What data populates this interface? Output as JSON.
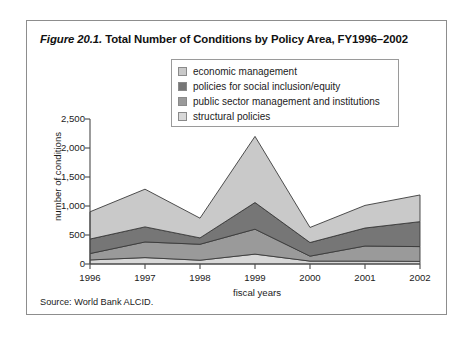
{
  "figure": {
    "number": "Figure 20.1.",
    "title": " Total Number of Conditions by Policy Area, FY1996–2002",
    "source": "Source: World Bank ALCID."
  },
  "legend": {
    "items": [
      {
        "label": "economic management",
        "color": "#c9c9c9"
      },
      {
        "label": "policies for social inclusion/equity",
        "color": "#767676"
      },
      {
        "label": "public sector management and institutions",
        "color": "#9a9a9a"
      },
      {
        "label": "structural policies",
        "color": "#d8d8d8"
      }
    ]
  },
  "axes": {
    "y_title": "number of conditions",
    "x_title": "fiscal years",
    "y_ticks": [
      "0",
      "500",
      "1,000",
      "1,500",
      "2,000",
      "2,500"
    ],
    "x_ticks": [
      "1996",
      "1997",
      "1998",
      "1999",
      "2000",
      "2001",
      "2002"
    ]
  },
  "chart_data": {
    "type": "area",
    "title": "Total Number of Conditions by Policy Area, FY1996–2002",
    "xlabel": "fiscal years",
    "ylabel": "number of conditions",
    "ylim": [
      0,
      2500
    ],
    "xlim": [
      "1996",
      "2002"
    ],
    "grid": false,
    "legend_position": "top-center",
    "stacked": true,
    "stack_order_bottom_to_top": [
      "structural policies",
      "public sector management and institutions",
      "policies for social inclusion/equity",
      "economic management"
    ],
    "categories": [
      "1996",
      "1997",
      "1998",
      "1999",
      "2000",
      "2001",
      "2002"
    ],
    "series": [
      {
        "name": "structural policies",
        "color": "#d8d8d8",
        "values": [
          70,
          110,
          65,
          170,
          50,
          50,
          45
        ]
      },
      {
        "name": "public sector management and institutions",
        "color": "#9a9a9a",
        "values": [
          110,
          270,
          275,
          430,
          85,
          260,
          255
        ]
      },
      {
        "name": "policies for social inclusion/equity",
        "color": "#767676",
        "values": [
          250,
          260,
          110,
          460,
          235,
          310,
          430
        ]
      },
      {
        "name": "economic management",
        "color": "#c9c9c9",
        "values": [
          470,
          650,
          340,
          1140,
          260,
          390,
          460
        ]
      }
    ],
    "cumulative_totals": [
      900,
      1290,
      790,
      2200,
      630,
      1010,
      1190
    ]
  }
}
